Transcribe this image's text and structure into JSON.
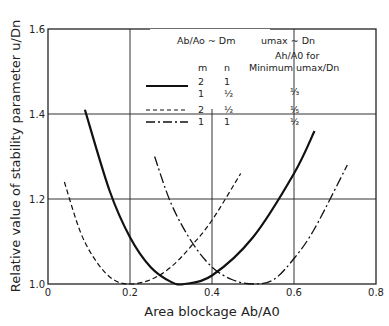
{
  "chart_data": {
    "type": "line",
    "title": "",
    "xlabel": "Area blockage Ab/A0",
    "ylabel": "Relative value of stability parameter u/Dn",
    "xlim": [
      0,
      0.8
    ],
    "ylim": [
      1.0,
      1.6
    ],
    "xticks": [
      "0",
      "0.2",
      "0.4",
      "0.6",
      "0.8"
    ],
    "yticks": [
      "1.0",
      "1.2",
      "1.4",
      "1.6"
    ],
    "grid": true,
    "legend": {
      "header_left": "Ab/Ao ~ Dm",
      "header_right": "umax ~ Dn",
      "col_m": "m",
      "col_n": "n",
      "col_opt_line1": "Ah/A0  for",
      "col_opt_line2": "Minimum  umax/Dn",
      "rows": [
        {
          "style": "solid",
          "m": "2",
          "n": "1",
          "m2": "1",
          "n2": "½",
          "opt": "⅓"
        },
        {
          "style": "dashed",
          "m": "2",
          "n": "½",
          "opt": "⅕"
        },
        {
          "style": "dash-dot",
          "m": "1",
          "n": "1",
          "opt": "½"
        }
      ]
    },
    "series": [
      {
        "name": "solid (m=2,n=1 / m=1,n=½)",
        "style": "solid",
        "x": [
          0.09,
          0.15,
          0.2,
          0.25,
          0.3,
          0.333,
          0.4,
          0.5,
          0.6,
          0.65
        ],
        "y": [
          1.41,
          1.22,
          1.11,
          1.04,
          1.005,
          1.0,
          1.02,
          1.11,
          1.26,
          1.36
        ]
      },
      {
        "name": "dashed (m=2,n=½)",
        "style": "dashed",
        "x": [
          0.04,
          0.08,
          0.12,
          0.16,
          0.2,
          0.25,
          0.3,
          0.35,
          0.4,
          0.47
        ],
        "y": [
          1.24,
          1.12,
          1.05,
          1.01,
          1.0,
          1.01,
          1.04,
          1.09,
          1.15,
          1.26
        ]
      },
      {
        "name": "dash-dot (m=1,n=1)",
        "style": "dash-dot",
        "x": [
          0.26,
          0.3,
          0.35,
          0.4,
          0.45,
          0.5,
          0.55,
          0.6,
          0.65,
          0.73
        ],
        "y": [
          1.3,
          1.19,
          1.1,
          1.04,
          1.01,
          1.0,
          1.01,
          1.06,
          1.13,
          1.28
        ]
      }
    ]
  }
}
